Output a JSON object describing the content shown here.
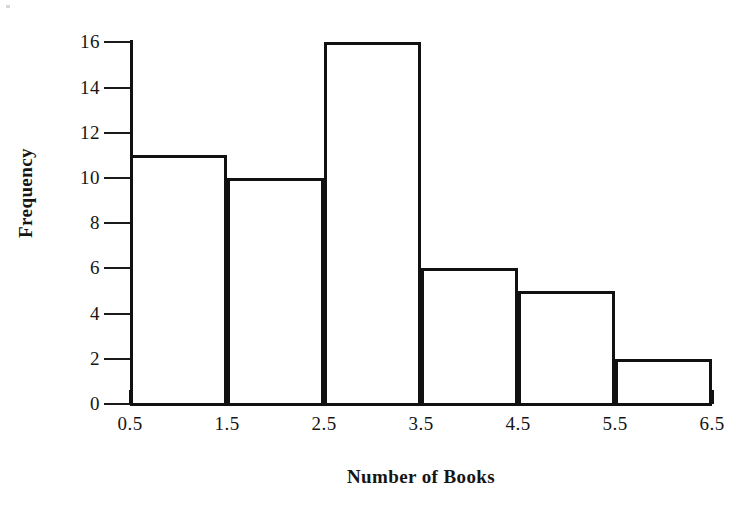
{
  "chart_data": {
    "type": "bar",
    "title": "",
    "xlabel": "Number of Books",
    "ylabel": "Frequency",
    "categories": [
      "0.5-1.5",
      "1.5-2.5",
      "2.5-3.5",
      "3.5-4.5",
      "4.5-5.5",
      "5.5-6.5"
    ],
    "values": [
      11,
      10,
      16,
      6,
      5,
      2
    ],
    "bin_edges": [
      0.5,
      1.5,
      2.5,
      3.5,
      4.5,
      5.5,
      6.5
    ],
    "x_tick_labels": [
      "0.5",
      "1.5",
      "2.5",
      "3.5",
      "4.5",
      "5.5",
      "6.5"
    ],
    "y_tick_labels": [
      "0",
      "2",
      "4",
      "6",
      "8",
      "10",
      "12",
      "14",
      "16"
    ],
    "y_tick_values": [
      0,
      2,
      4,
      6,
      8,
      10,
      12,
      14,
      16
    ],
    "xlim": [
      0.5,
      6.5
    ],
    "ylim": [
      0,
      16
    ],
    "grid": false,
    "legend": false,
    "bar_fill_color": "#ffffff",
    "bar_edge_color": "#111111",
    "axis_color": "#111111",
    "background_color": "#ffffff"
  }
}
